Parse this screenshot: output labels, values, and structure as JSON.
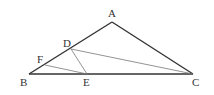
{
  "diagram": {
    "type": "geometry-triangle",
    "points": {
      "A": {
        "label": "A",
        "x": 112,
        "y": 22,
        "lx": 108,
        "ly": 17
      },
      "B": {
        "label": "B",
        "x": 29,
        "y": 74,
        "lx": 20,
        "ly": 86
      },
      "C": {
        "label": "C",
        "x": 193,
        "y": 74,
        "lx": 192,
        "ly": 86
      },
      "D": {
        "label": "D",
        "x": 71,
        "y": 49,
        "lx": 63,
        "ly": 47
      },
      "E": {
        "label": "E",
        "x": 87,
        "y": 74,
        "lx": 83,
        "ly": 86
      },
      "F": {
        "label": "F",
        "x": 45,
        "y": 65,
        "lx": 37,
        "ly": 63
      }
    },
    "segments": [
      {
        "from": "A",
        "to": "B",
        "weight": "thick"
      },
      {
        "from": "A",
        "to": "C",
        "weight": "thick"
      },
      {
        "from": "B",
        "to": "C",
        "weight": "thick"
      },
      {
        "from": "D",
        "to": "C",
        "weight": "thin"
      },
      {
        "from": "D",
        "to": "E",
        "weight": "thin"
      },
      {
        "from": "F",
        "to": "E",
        "weight": "thin"
      }
    ],
    "colors": {
      "thick": "#333333",
      "thin": "#777777"
    }
  }
}
